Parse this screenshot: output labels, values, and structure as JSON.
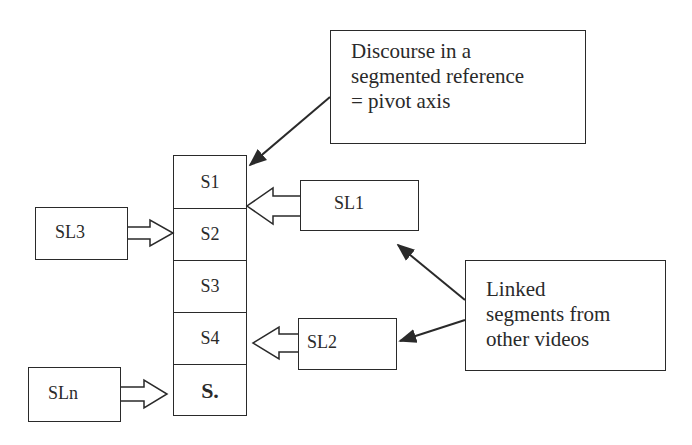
{
  "diagram": {
    "pivot_note": {
      "text": "Discourse in a\nsegmented reference\n= pivot axis"
    },
    "linked_note": {
      "text": "Linked\nsegments  from\nother videos"
    },
    "pivot_segments": [
      {
        "label": "S1"
      },
      {
        "label": "S2"
      },
      {
        "label": "S3"
      },
      {
        "label": "S4"
      },
      {
        "label": "S."
      }
    ],
    "linked_segments": [
      {
        "label": "SL1",
        "targets": "S1"
      },
      {
        "label": "SL2",
        "targets": "S4"
      },
      {
        "label": "SL3",
        "targets": "S2"
      },
      {
        "label": "SLn",
        "targets": "S."
      }
    ],
    "colors": {
      "stroke": "#2a2a2a",
      "background": "#ffffff"
    }
  }
}
